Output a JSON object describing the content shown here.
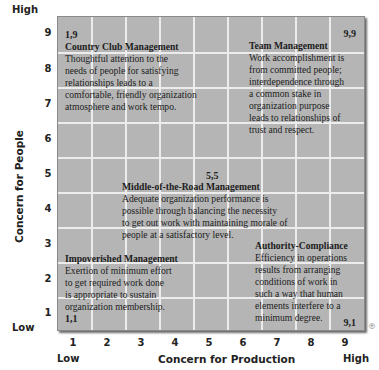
{
  "diagram": {
    "type": "managerial-grid",
    "background_color": "#b5b5b5",
    "gridline_color": "#ececec"
  },
  "y_axis": {
    "title": "Concern for People",
    "high_label": "High",
    "low_label": "Low",
    "ticks": [
      "9",
      "8",
      "7",
      "6",
      "5",
      "4",
      "3",
      "2",
      "1"
    ]
  },
  "x_axis": {
    "title": "Concern for Production",
    "low_label": "Low",
    "high_label": "High",
    "ticks": [
      "1",
      "2",
      "3",
      "4",
      "5",
      "6",
      "7",
      "8",
      "9"
    ]
  },
  "styles": {
    "country_club": {
      "coord": "1,9",
      "title": "Country Club Management",
      "lines": [
        "Thoughtful attention to the",
        "needs of people for satisfying",
        "relationships leads to a",
        "comfortable, friendly organization",
        "atmosphere and work tempo."
      ]
    },
    "team": {
      "coord": "9,9",
      "title": "Team Management",
      "lines": [
        "Work accomplishment is",
        "from committed people;",
        "interdependence through",
        "a common stake in",
        "organization purpose",
        "leads to relationships of",
        "trust and respect."
      ]
    },
    "middle_of_the_road": {
      "coord": "5,5",
      "title": "Middle-of-the-Road Management",
      "lines": [
        "Adequate organization performance is",
        "possible through balancing the necessity",
        "to get out work with maintaining morale of",
        "people at a satisfactory level."
      ]
    },
    "impoverished": {
      "coord": "1,1",
      "title": "Impoverished Management",
      "lines": [
        "Exertion of minimum effort",
        "to get required work done",
        "is appropriate to sustain",
        "organization membership."
      ]
    },
    "authority_compliance": {
      "coord": "9,1",
      "title": "Authority-Compliance",
      "lines": [
        "Efficiency in operations",
        "results from arranging",
        "conditions of work in",
        "such a way that human",
        "elements interfere to a",
        "minimum degree."
      ]
    }
  },
  "registered_mark": "®"
}
